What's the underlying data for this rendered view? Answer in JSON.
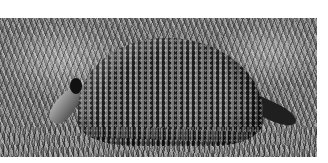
{
  "image": {
    "subject": "armadillo",
    "description": "Black-and-white photograph of a nine-banded armadillo foraging in tall grass",
    "style": "grayscale photograph",
    "colors": {
      "background": "#ffffff",
      "shell_dark": "#1c1c1c",
      "shell_light": "#777777",
      "grass": "#7a7a7a"
    }
  }
}
